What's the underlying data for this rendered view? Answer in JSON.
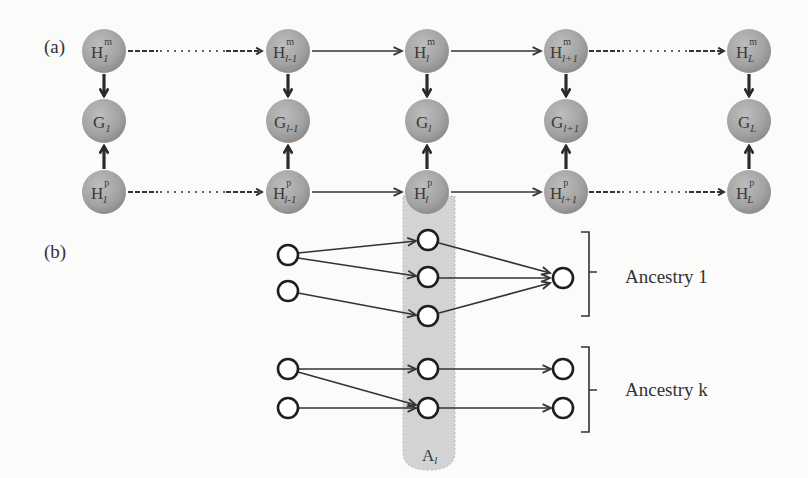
{
  "figure": {
    "panel_a_label": "(a)",
    "panel_b_label": "(b)",
    "colors": {
      "background": "#fbfbfa",
      "node_fill": "#a8a8a8",
      "node_text": "#3a3a3a",
      "edge": "#333333",
      "highlight_column": "#d2d2d2",
      "open_node_stroke": "#1e1e1e"
    }
  },
  "panel_a": {
    "columns": [
      {
        "index": "1",
        "hm": {
          "base": "H",
          "sup": "m",
          "sub": "1"
        },
        "g": {
          "base": "G",
          "sub": "1"
        },
        "hp": {
          "base": "H",
          "sup": "p",
          "sub": "1"
        }
      },
      {
        "index": "l-1",
        "hm": {
          "base": "H",
          "sup": "m",
          "sub": "l-1"
        },
        "g": {
          "base": "G",
          "sub": "l-1"
        },
        "hp": {
          "base": "H",
          "sup": "p",
          "sub": "l-1"
        }
      },
      {
        "index": "l",
        "hm": {
          "base": "H",
          "sup": "m",
          "sub": "l"
        },
        "g": {
          "base": "G",
          "sub": "l"
        },
        "hp": {
          "base": "H",
          "sup": "p",
          "sub": "l"
        }
      },
      {
        "index": "l+1",
        "hm": {
          "base": "H",
          "sup": "m",
          "sub": "l+1"
        },
        "g": {
          "base": "G",
          "sub": "l+1"
        },
        "hp": {
          "base": "H",
          "sup": "p",
          "sub": "l+1"
        }
      },
      {
        "index": "L",
        "hm": {
          "base": "H",
          "sup": "m",
          "sub": "L"
        },
        "g": {
          "base": "G",
          "sub": "L"
        },
        "hp": {
          "base": "H",
          "sup": "p",
          "sub": "L"
        }
      }
    ],
    "edges": [
      {
        "from": "1",
        "to": "l-1",
        "style": "dashed-dotted"
      },
      {
        "from": "l-1",
        "to": "l",
        "style": "solid"
      },
      {
        "from": "l",
        "to": "l+1",
        "style": "solid"
      },
      {
        "from": "l+1",
        "to": "L",
        "style": "dashed-dotted"
      }
    ]
  },
  "panel_b": {
    "highlight_label": {
      "base": "A",
      "sub": "l"
    },
    "groups": [
      {
        "label": "Ancestry 1"
      },
      {
        "label": "Ancestry k"
      }
    ]
  }
}
